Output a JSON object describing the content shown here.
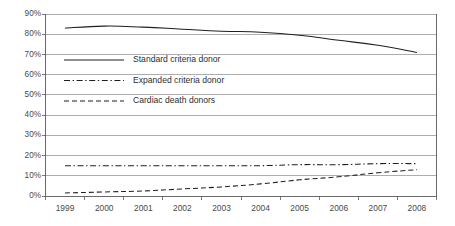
{
  "chart_data": {
    "type": "line",
    "title": "",
    "subtitle": "",
    "xlabel": "",
    "ylabel": "",
    "categories": [
      "1999",
      "2000",
      "2001",
      "2002",
      "2003",
      "2004",
      "2005",
      "2006",
      "2007",
      "2008"
    ],
    "x": [
      1999,
      2000,
      2001,
      2002,
      2003,
      2004,
      2005,
      2006,
      2007,
      2008
    ],
    "ylim": [
      0,
      90
    ],
    "xlim": [
      1999,
      2008
    ],
    "y_tick_labels": [
      "0%",
      "10%",
      "20%",
      "30%",
      "40%",
      "50%",
      "60%",
      "70%",
      "80%",
      "90%"
    ],
    "y_tick_values": [
      0,
      10,
      20,
      30,
      40,
      50,
      60,
      70,
      80,
      90
    ],
    "y_unit": "%",
    "y_tick_step": 10,
    "grid": "horizontal",
    "legend_position": "inside-upper-left",
    "series": [
      {
        "name": "Standard criteria donor",
        "line_style": "solid",
        "color": "#1f1f1f",
        "values": [
          83,
          84,
          83.5,
          82.5,
          81.5,
          81,
          79.5,
          77,
          74.5,
          71
        ]
      },
      {
        "name": "Expanded criteria donor",
        "line_style": "dash-dot",
        "color": "#1f1f1f",
        "values": [
          15,
          15,
          15,
          15,
          15,
          15,
          15.5,
          15.5,
          16,
          16
        ]
      },
      {
        "name": "Cardiac death donors",
        "line_style": "dashed",
        "color": "#1f1f1f",
        "values": [
          1.5,
          2,
          2.5,
          3.5,
          4.5,
          6,
          8,
          9.5,
          11.5,
          13
        ]
      }
    ]
  },
  "legend": {
    "entries": [
      {
        "label": "Standard criteria donor",
        "style": "solid"
      },
      {
        "label": "Expanded criteria donor",
        "style": "dash-dot"
      },
      {
        "label": "Cardiac death donors",
        "style": "dashed"
      }
    ]
  },
  "colors": {
    "series_line": "#1f1f1f",
    "gridline": "#8a8a8a",
    "frame": "#5a5a5a",
    "tick_text": "#4a4a4a",
    "legend_text": "#2e2e2e",
    "background": "#ffffff"
  }
}
